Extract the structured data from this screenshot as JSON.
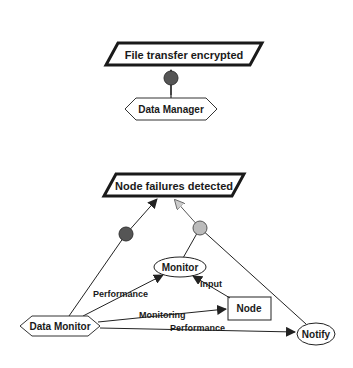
{
  "diagram": {
    "top_group": {
      "goal": "File transfer encrypted",
      "agent": "Data Manager"
    },
    "bottom_group": {
      "goal": "Node failures detected",
      "agent": "Data Monitor",
      "nodes": {
        "monitor": "Monitor",
        "node": "Node",
        "notify": "Notify"
      },
      "edge_labels": {
        "performance_to_monitor": "Performance",
        "input": "Input",
        "monitoring": "Monitoring",
        "performance_to_notify": "Performance"
      }
    },
    "colors": {
      "dark_circle": "#555555",
      "light_circle": "#bbbbbb",
      "stroke": "#1a1a1a"
    }
  }
}
